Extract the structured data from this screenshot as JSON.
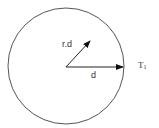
{
  "diagram": {
    "circle": {
      "cx": 66,
      "cy": 66,
      "r": 58,
      "stroke": "#555555"
    },
    "vectors": [
      {
        "name": "rd",
        "label": "r.d",
        "from": [
          66,
          67
        ],
        "to": [
          90,
          41
        ]
      },
      {
        "name": "d",
        "label": "d",
        "from": [
          66,
          67
        ],
        "to": [
          123,
          67
        ]
      }
    ],
    "boundary_label": {
      "main": "T",
      "subscript": "1"
    },
    "colors": {
      "stroke": "#555555",
      "arrow": "#111111",
      "text": "#333333"
    }
  }
}
